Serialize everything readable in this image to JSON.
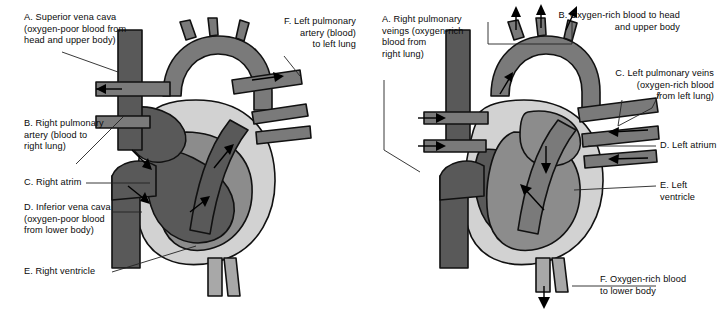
{
  "figure": {
    "type": "anatomical-diagram",
    "panel_count": 2,
    "colors": {
      "deoxygenated_chamber": "#595959",
      "oxygenated_chamber": "#8c8c8c",
      "myocardium_wall": "#d2d2d2",
      "vessel_mid": "#7a7a7a",
      "outline": "#111111",
      "background": "#ffffff",
      "text": "#0a0a0a"
    }
  },
  "panels": [
    {
      "id": "left",
      "topic": "Oxygen-poor blood pathway (right side of heart)",
      "labels": [
        {
          "key": "A",
          "name": "superior-vena-cava",
          "text": "A. Superior vena cava\n(oxygen-poor blood from\nhead and upper body)",
          "align": "left"
        },
        {
          "key": "B",
          "name": "right-pulmonary-artery",
          "text": "B. Right pulmonary\nartery (blood to\nright lung)",
          "align": "left"
        },
        {
          "key": "C",
          "name": "right-atrium",
          "text": "C. Right atrim",
          "align": "left"
        },
        {
          "key": "D",
          "name": "inferior-vena-cava",
          "text": "D. Inferior vena cava\n(oxygen-poor blood\nfrom lower body)",
          "align": "left"
        },
        {
          "key": "E",
          "name": "right-ventricle",
          "text": "E. Right ventricle",
          "align": "left"
        },
        {
          "key": "F",
          "name": "left-pulmonary-artery",
          "text": "F. Left pulmonary\nartery (blood)\nto left lung",
          "align": "right"
        }
      ],
      "flow_arrows": [
        {
          "name": "arrow-right-pulmonary-artery-out",
          "direction": "left"
        },
        {
          "name": "arrow-left-pulmonary-artery-out",
          "direction": "right"
        },
        {
          "name": "arrow-svc-into-atrium",
          "direction": "down-right"
        },
        {
          "name": "arrow-ivc-into-atrium",
          "direction": "down-right"
        },
        {
          "name": "arrow-atrium-into-ventricle",
          "direction": "up-right"
        },
        {
          "name": "arrow-ventricle-into-pulmonary-trunk",
          "direction": "up-right"
        }
      ]
    },
    {
      "id": "right",
      "topic": "Oxygen-rich blood pathway (left side of heart)",
      "labels": [
        {
          "key": "A",
          "name": "right-pulmonary-veins",
          "text": "A. Right pulmonary\nveings (oxygen-rich\nblood from\nright lung)",
          "align": "left"
        },
        {
          "key": "B",
          "name": "oxygen-rich-blood-to-head",
          "text": "B. Oxygen-rich blood to head\nand upper body",
          "align": "right"
        },
        {
          "key": "C",
          "name": "left-pulmonary-veins",
          "text": "C. Left pulmonary veins\n(oxygen-rich blood\nfrom left lung)",
          "align": "right"
        },
        {
          "key": "D",
          "name": "left-atrium",
          "text": "D. Left atrium",
          "align": "left"
        },
        {
          "key": "E",
          "name": "left-ventricle",
          "text": "E. Left ventricle",
          "align": "left"
        },
        {
          "key": "F",
          "name": "oxygen-rich-blood-to-lower-body",
          "text": "F. Oxygen-rich blood\nto lower body",
          "align": "left"
        }
      ],
      "flow_arrows": [
        {
          "name": "arrow-right-pulmonary-vein-in-upper",
          "direction": "right"
        },
        {
          "name": "arrow-right-pulmonary-vein-in-lower",
          "direction": "right"
        },
        {
          "name": "arrow-left-pulmonary-vein-in-upper",
          "direction": "left"
        },
        {
          "name": "arrow-left-pulmonary-vein-in-lower",
          "direction": "left"
        },
        {
          "name": "arrow-aortic-branch-one",
          "direction": "up"
        },
        {
          "name": "arrow-aortic-branch-two",
          "direction": "up"
        },
        {
          "name": "arrow-aortic-branch-three",
          "direction": "up-right"
        },
        {
          "name": "arrow-aortic-arch-flow",
          "direction": "up-right"
        },
        {
          "name": "arrow-atrium-into-ventricle",
          "direction": "down"
        },
        {
          "name": "arrow-ventricle-into-aorta",
          "direction": "up-left"
        },
        {
          "name": "arrow-descending-aorta-out",
          "direction": "down"
        }
      ]
    }
  ]
}
